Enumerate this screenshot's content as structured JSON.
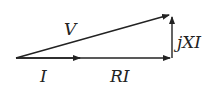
{
  "diagram": {
    "type": "phasor diagram",
    "labels": {
      "v": "V",
      "i": "I",
      "ri": "RI",
      "jxi": "jXI"
    },
    "vectors": [
      {
        "name": "I",
        "from": [
          16,
          58
        ],
        "to": [
          80,
          58
        ]
      },
      {
        "name": "RI",
        "from": [
          16,
          58
        ],
        "to": [
          172,
          58
        ]
      },
      {
        "name": "jXI",
        "from": [
          172,
          58
        ],
        "to": [
          172,
          15
        ]
      },
      {
        "name": "V",
        "from": [
          16,
          58
        ],
        "to": [
          172,
          14
        ]
      }
    ],
    "color": "#222222"
  }
}
